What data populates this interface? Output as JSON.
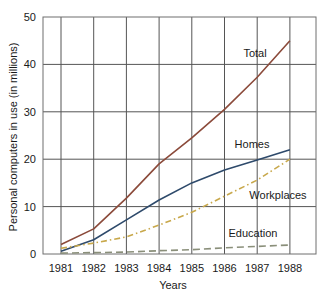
{
  "chart_data": {
    "type": "line",
    "title": "",
    "xlabel": "Years",
    "ylabel": "Personal computers in use (in millions)",
    "x": [
      1981,
      1982,
      1983,
      1984,
      1985,
      1986,
      1987,
      1988
    ],
    "x_tick_labels": [
      "1981",
      "1982",
      "1983",
      "1984",
      "1985",
      "1986",
      "1987",
      "1988"
    ],
    "y_ticks": [
      0,
      10,
      20,
      30,
      40,
      50
    ],
    "ylim": [
      0,
      50
    ],
    "grid": true,
    "legend_position": "inline labels",
    "series": [
      {
        "name": "Total",
        "values": [
          2.0,
          5.3,
          11.8,
          19.0,
          24.5,
          30.5,
          37.3,
          45.0
        ],
        "color": "#8b4a3a",
        "style": "solid",
        "label_pos": [
          255,
          57
        ]
      },
      {
        "name": "Homes",
        "values": [
          0.6,
          3.0,
          7.2,
          11.4,
          15.0,
          17.7,
          19.8,
          22.0
        ],
        "color": "#2e4a6b",
        "style": "solid",
        "label_pos": [
          252,
          148
        ]
      },
      {
        "name": "Workplaces",
        "values": [
          1.2,
          2.3,
          3.6,
          6.1,
          8.8,
          12.2,
          15.6,
          20.0
        ],
        "color": "#c8a84b",
        "style": "dashdot",
        "label_pos": [
          278,
          199
        ]
      },
      {
        "name": "Education",
        "values": [
          0.2,
          0.3,
          0.4,
          0.7,
          0.9,
          1.3,
          1.6,
          1.9
        ],
        "color": "#8a8f7a",
        "style": "dashed",
        "label_pos": [
          253,
          237
        ]
      }
    ]
  }
}
